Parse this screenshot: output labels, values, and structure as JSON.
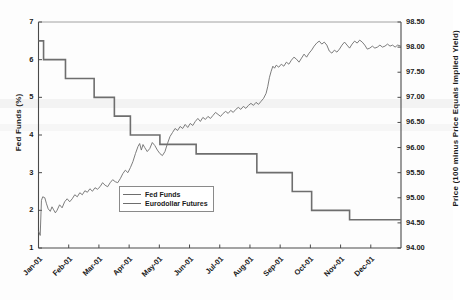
{
  "chart_data": {
    "type": "line",
    "title": "",
    "subtitle": "",
    "xlabel": "",
    "ylabel": "Fed Funds (%)",
    "y2label": "Price (100 minus Price Equals Implied Yield)",
    "grid": false,
    "legend_position": "inside-lower-left",
    "x_tick_labels": [
      "Jan-01",
      "Feb-01",
      "Mar-01",
      "Apr-01",
      "May-01",
      "Jun-01",
      "Jul-01",
      "Aug-01",
      "Sep-01",
      "Oct-01",
      "Nov-01",
      "Dec-01"
    ],
    "ylim": [
      1,
      7
    ],
    "y_tick_labels": [
      "1",
      "2",
      "3",
      "4",
      "5",
      "6",
      "7"
    ],
    "y_ticks": [
      1,
      2,
      3,
      4,
      5,
      6,
      7
    ],
    "y2lim": [
      94.0,
      98.5
    ],
    "y2_tick_labels": [
      "94.00",
      "94.50",
      "95.00",
      "95.50",
      "96.00",
      "96.50",
      "97.00",
      "97.50",
      "98.00",
      "98.50"
    ],
    "y2_ticks": [
      94.0,
      94.5,
      95.0,
      95.5,
      96.0,
      96.5,
      97.0,
      97.5,
      98.0,
      98.5
    ],
    "series": [
      {
        "name": "Fed Funds",
        "axis": "left",
        "style": "step",
        "color": "#6e6e6e",
        "width": 1.6,
        "points": [
          [
            0.0,
            6.5
          ],
          [
            0.6,
            6.5
          ],
          [
            0.6,
            6.0
          ],
          [
            3.2,
            6.0
          ],
          [
            3.2,
            5.5
          ],
          [
            6.6,
            5.5
          ],
          [
            6.6,
            5.0
          ],
          [
            9.0,
            5.0
          ],
          [
            9.0,
            4.5
          ],
          [
            10.9,
            4.5
          ],
          [
            10.9,
            4.0
          ],
          [
            14.4,
            4.0
          ],
          [
            14.4,
            3.75
          ],
          [
            18.7,
            3.75
          ],
          [
            18.7,
            3.5
          ],
          [
            25.9,
            3.5
          ],
          [
            25.9,
            3.0
          ],
          [
            30.1,
            3.0
          ],
          [
            30.1,
            2.5
          ],
          [
            32.4,
            2.5
          ],
          [
            32.4,
            2.0
          ],
          [
            36.9,
            2.0
          ],
          [
            36.9,
            1.75
          ],
          [
            43.0,
            1.75
          ]
        ]
      },
      {
        "name": "Eurodollar Futures",
        "axis": "right",
        "style": "line",
        "color": "#6e6e6e",
        "width": 0.9,
        "points": [
          [
            0.0,
            94.34
          ],
          [
            0.2,
            94.25
          ],
          [
            0.35,
            94.95
          ],
          [
            0.5,
            95.02
          ],
          [
            0.75,
            95.0
          ],
          [
            0.95,
            94.88
          ],
          [
            1.15,
            94.78
          ],
          [
            1.4,
            94.73
          ],
          [
            1.6,
            94.82
          ],
          [
            1.8,
            94.76
          ],
          [
            2.0,
            94.7
          ],
          [
            2.2,
            94.75
          ],
          [
            2.5,
            94.86
          ],
          [
            2.8,
            94.8
          ],
          [
            3.1,
            94.92
          ],
          [
            3.4,
            94.98
          ],
          [
            3.7,
            94.92
          ],
          [
            4.0,
            94.98
          ],
          [
            4.3,
            95.06
          ],
          [
            4.6,
            95.02
          ],
          [
            4.9,
            95.1
          ],
          [
            5.2,
            95.06
          ],
          [
            5.5,
            95.14
          ],
          [
            5.8,
            95.11
          ],
          [
            6.1,
            95.18
          ],
          [
            6.4,
            95.13
          ],
          [
            6.7,
            95.2
          ],
          [
            7.0,
            95.17
          ],
          [
            7.3,
            95.22
          ],
          [
            7.6,
            95.3
          ],
          [
            7.9,
            95.25
          ],
          [
            8.2,
            95.22
          ],
          [
            8.5,
            95.3
          ],
          [
            8.8,
            95.36
          ],
          [
            9.1,
            95.32
          ],
          [
            9.4,
            95.3
          ],
          [
            9.7,
            95.38
          ],
          [
            10.0,
            95.48
          ],
          [
            10.3,
            95.55
          ],
          [
            10.6,
            95.5
          ],
          [
            10.9,
            95.6
          ],
          [
            11.2,
            95.72
          ],
          [
            11.5,
            95.88
          ],
          [
            11.8,
            96.02
          ],
          [
            12.0,
            96.08
          ],
          [
            12.2,
            95.95
          ],
          [
            12.4,
            96.06
          ],
          [
            12.6,
            96.0
          ],
          [
            12.9,
            95.92
          ],
          [
            13.2,
            95.98
          ],
          [
            13.5,
            96.1
          ],
          [
            13.8,
            96.04
          ],
          [
            14.1,
            95.95
          ],
          [
            14.4,
            95.88
          ],
          [
            14.7,
            95.84
          ],
          [
            15.0,
            95.92
          ],
          [
            15.3,
            96.08
          ],
          [
            15.6,
            96.22
          ],
          [
            15.9,
            96.3
          ],
          [
            16.2,
            96.38
          ],
          [
            16.5,
            96.34
          ],
          [
            16.8,
            96.42
          ],
          [
            17.1,
            96.38
          ],
          [
            17.4,
            96.46
          ],
          [
            17.7,
            96.4
          ],
          [
            18.0,
            96.48
          ],
          [
            18.3,
            96.44
          ],
          [
            18.6,
            96.52
          ],
          [
            18.9,
            96.58
          ],
          [
            19.2,
            96.52
          ],
          [
            19.5,
            96.6
          ],
          [
            19.8,
            96.56
          ],
          [
            20.1,
            96.62
          ],
          [
            20.4,
            96.58
          ],
          [
            20.7,
            96.64
          ],
          [
            21.0,
            96.7
          ],
          [
            21.3,
            96.66
          ],
          [
            21.6,
            96.62
          ],
          [
            21.9,
            96.68
          ],
          [
            22.2,
            96.72
          ],
          [
            22.5,
            96.68
          ],
          [
            22.8,
            96.74
          ],
          [
            23.1,
            96.7
          ],
          [
            23.4,
            96.76
          ],
          [
            23.7,
            96.8
          ],
          [
            24.0,
            96.76
          ],
          [
            24.3,
            96.82
          ],
          [
            24.6,
            96.78
          ],
          [
            24.9,
            96.84
          ],
          [
            25.2,
            96.88
          ],
          [
            25.5,
            96.84
          ],
          [
            25.8,
            96.9
          ],
          [
            26.1,
            96.86
          ],
          [
            26.4,
            96.92
          ],
          [
            26.7,
            96.98
          ],
          [
            27.0,
            97.08
          ],
          [
            27.2,
            97.22
          ],
          [
            27.4,
            97.4
          ],
          [
            27.6,
            97.52
          ],
          [
            27.8,
            97.62
          ],
          [
            28.0,
            97.58
          ],
          [
            28.2,
            97.64
          ],
          [
            28.5,
            97.6
          ],
          [
            28.8,
            97.66
          ],
          [
            29.1,
            97.62
          ],
          [
            29.4,
            97.7
          ],
          [
            29.7,
            97.66
          ],
          [
            30.0,
            97.74
          ],
          [
            30.3,
            97.8
          ],
          [
            30.6,
            97.76
          ],
          [
            30.9,
            97.7
          ],
          [
            31.2,
            97.78
          ],
          [
            31.5,
            97.86
          ],
          [
            31.8,
            97.8
          ],
          [
            32.1,
            97.88
          ],
          [
            32.4,
            97.94
          ],
          [
            32.7,
            98.02
          ],
          [
            33.0,
            98.08
          ],
          [
            33.3,
            98.12
          ],
          [
            33.6,
            98.06
          ],
          [
            33.9,
            98.1
          ],
          [
            34.2,
            98.04
          ],
          [
            34.5,
            97.92
          ],
          [
            34.8,
            97.88
          ],
          [
            35.1,
            97.94
          ],
          [
            35.4,
            97.9
          ],
          [
            35.7,
            97.96
          ],
          [
            36.0,
            98.04
          ],
          [
            36.3,
            98.1
          ],
          [
            36.6,
            98.04
          ],
          [
            36.9,
            97.98
          ],
          [
            37.2,
            98.06
          ],
          [
            37.5,
            98.12
          ],
          [
            37.8,
            98.08
          ],
          [
            38.1,
            98.14
          ],
          [
            38.4,
            98.1
          ],
          [
            38.7,
            98.04
          ],
          [
            39.0,
            97.96
          ],
          [
            39.3,
            97.98
          ],
          [
            39.6,
            98.02
          ],
          [
            39.9,
            97.98
          ],
          [
            40.2,
            98.0
          ],
          [
            40.5,
            98.04
          ],
          [
            40.8,
            98.0
          ],
          [
            41.1,
            98.02
          ],
          [
            41.4,
            98.06
          ],
          [
            41.7,
            98.02
          ],
          [
            42.0,
            98.04
          ],
          [
            42.3,
            98.0
          ],
          [
            42.6,
            98.04
          ],
          [
            43.0,
            98.02
          ]
        ]
      }
    ]
  },
  "legend": {
    "items": [
      {
        "label": "Fed Funds"
      },
      {
        "label": "Eurodollar Futures"
      }
    ]
  }
}
